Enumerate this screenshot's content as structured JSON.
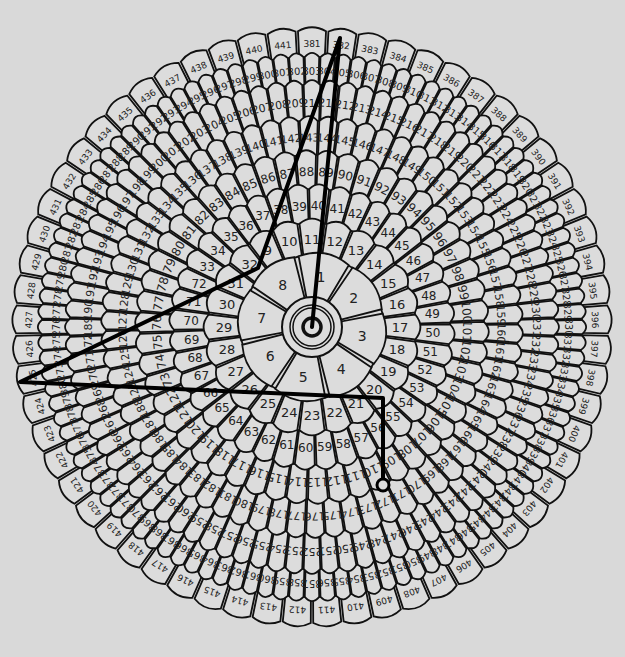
{
  "caption": "",
  "diagram": {
    "center": [
      312,
      327
    ],
    "background": "#d9d9d9",
    "petal_fill": "#dcdcdc",
    "stroke": "#111111",
    "rings": [
      {
        "name": "inner-flower",
        "start": 1,
        "end": 8,
        "r_in": 30,
        "r_out": 72,
        "font": 14,
        "start_angle": 80
      },
      {
        "name": "ring-2",
        "start": 9,
        "end": 32,
        "r_in": 72,
        "r_out": 104,
        "font": 13,
        "start_angle": 120
      },
      {
        "name": "ring-3",
        "start": 33,
        "end": 72,
        "r_in": 104,
        "r_out": 138,
        "font": 12,
        "start_angle": 150
      },
      {
        "name": "ring-4",
        "start": 73,
        "end": 122,
        "r_in": 138,
        "r_out": 172,
        "font": 12,
        "start_angle": 200
      },
      {
        "name": "ring-5",
        "start": 123,
        "end": 188,
        "r_in": 172,
        "r_out": 206,
        "font": 11,
        "start_angle": 200
      },
      {
        "name": "ring-6",
        "start": 189,
        "end": 272,
        "r_in": 206,
        "r_out": 242,
        "font": 11,
        "start_angle": 180
      },
      {
        "name": "ring-7",
        "start": 273,
        "end": 380,
        "r_in": 242,
        "r_out": 270,
        "font": 10,
        "start_angle": 190
      },
      {
        "name": "ring-8",
        "start": 381,
        "end": 441,
        "r_in": 270,
        "r_out": 296,
        "font": 9,
        "start_angle": 90
      }
    ],
    "path": {
      "points": [
        [
          312,
          327
        ],
        [
          340,
          38
        ],
        [
          258,
          268
        ],
        [
          20,
          382
        ],
        [
          383,
          398
        ],
        [
          383,
          485
        ]
      ],
      "start_marker": [
        312,
        327
      ],
      "end_marker": [
        383,
        485
      ],
      "color": "#000000"
    }
  }
}
